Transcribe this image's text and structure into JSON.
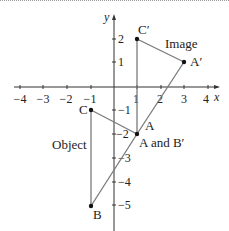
{
  "diagram": {
    "axes": {
      "x_label": "x",
      "y_label": "y",
      "x_ticks": [
        {
          "value": -4,
          "label": "−4"
        },
        {
          "value": -3,
          "label": "−3"
        },
        {
          "value": -2,
          "label": "−2"
        },
        {
          "value": -1,
          "label": "−1"
        },
        {
          "value": 1,
          "label": "1"
        },
        {
          "value": 2,
          "label": "2"
        },
        {
          "value": 3,
          "label": "3"
        },
        {
          "value": 4,
          "label": "4"
        }
      ],
      "y_ticks": [
        {
          "value": 2,
          "label": "2"
        },
        {
          "value": 1,
          "label": "1"
        },
        {
          "value": -1,
          "label": "−1"
        },
        {
          "value": -2,
          "label": "−2"
        },
        {
          "value": -3,
          "label": "−3"
        },
        {
          "value": -4,
          "label": "−4"
        },
        {
          "value": -5,
          "label": "−5"
        }
      ]
    },
    "points": {
      "C_prime": {
        "label": "C′",
        "x": 1,
        "y": 2
      },
      "A_prime": {
        "label": "A′",
        "x": 3,
        "y": 1
      },
      "C": {
        "label": "C",
        "x": -1,
        "y": -1
      },
      "A_B_prime": {
        "label": "A and B′",
        "x": 1,
        "y": -2
      },
      "A_line_label": {
        "label": "A"
      },
      "B": {
        "label": "B",
        "x": -1,
        "y": -5
      }
    },
    "shapes": {
      "image_label": "Image",
      "object_label": "Object"
    },
    "colors": {
      "line": "#7a7a7a",
      "axis": "#333333",
      "point": "#111111",
      "text": "#222222"
    }
  }
}
